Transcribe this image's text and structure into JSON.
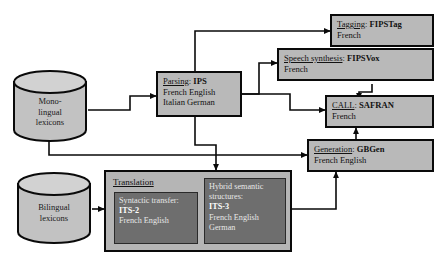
{
  "diagram": {
    "colors": {
      "box_fill": "#b9b9b9",
      "group_fill": "#b5b5b5",
      "subbox_fill": "#6e6e6e",
      "stroke": "#0a0a0a",
      "page_bg": "#ffffff"
    }
  },
  "stores": [
    {
      "id": "monolingual",
      "lines": [
        "Mono-",
        "lingual",
        "lexicons"
      ]
    },
    {
      "id": "bilingual",
      "lines": [
        "Bilingual",
        "lexicons"
      ]
    }
  ],
  "boxes": {
    "parsing": {
      "title": "Parsing",
      "sep": ": ",
      "name": "IPS",
      "langs": [
        "French English",
        "Italian German"
      ]
    },
    "tagging": {
      "title": "Tagging",
      "sep": ": ",
      "name": "FIPSTag",
      "langs": [
        "French"
      ]
    },
    "speech": {
      "title": "Speech synthesis",
      "sep": ": ",
      "name": "FIPSVox",
      "langs": [
        "French"
      ]
    },
    "call": {
      "title": "CALL",
      "sep": ": ",
      "name": "SAFRAN",
      "langs": [
        "French"
      ]
    },
    "generation": {
      "title": "Generation",
      "sep": ": ",
      "name": "GBGen",
      "langs": [
        "French English"
      ]
    }
  },
  "translation": {
    "title": "Translation",
    "syntactic": {
      "label": "Syntactic transfer:",
      "name": "ITS-2",
      "langs": [
        "French English"
      ]
    },
    "semantic": {
      "label_line1": "Hybrid semantic",
      "label_line2": "structures:",
      "name": "ITS-3",
      "langs": [
        "French English",
        "German"
      ]
    }
  },
  "connections": [
    {
      "from": "monolingual",
      "to": "parsing"
    },
    {
      "from": "monolingual",
      "to": "generation"
    },
    {
      "from": "parsing",
      "to": "tagging"
    },
    {
      "from": "parsing",
      "to": "speech"
    },
    {
      "from": "parsing",
      "to": "call"
    },
    {
      "from": "parsing",
      "to": "translation"
    },
    {
      "from": "speech",
      "to": "call"
    },
    {
      "from": "generation",
      "to": "call"
    },
    {
      "from": "bilingual",
      "to": "translation"
    },
    {
      "from": "translation",
      "to": "generation"
    }
  ]
}
